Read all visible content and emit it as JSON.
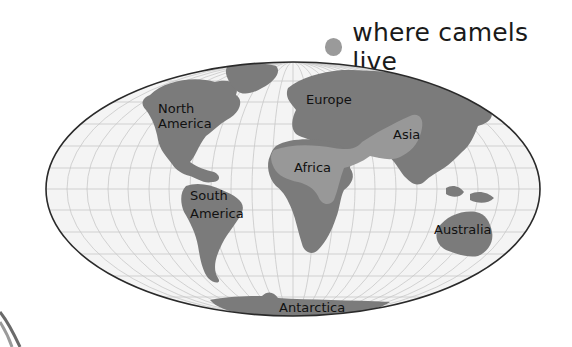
{
  "legend": {
    "label": "where camels live",
    "swatch_color": "#9a9a9a"
  },
  "map": {
    "projection": "Mollweide-style world ellipse",
    "colors": {
      "ocean": "#f4f4f4",
      "land": "#7b7b7b",
      "camel_range": "#989898",
      "graticule": "#c8c8c8",
      "border": "#2a2a2a"
    },
    "labels": {
      "north_america_1": "North",
      "north_america_2": "America",
      "south_america_1": "South",
      "south_america_2": "America",
      "europe": "Europe",
      "africa": "Africa",
      "asia": "Asia",
      "australia": "Australia",
      "antarctica": "Antarctica"
    }
  }
}
